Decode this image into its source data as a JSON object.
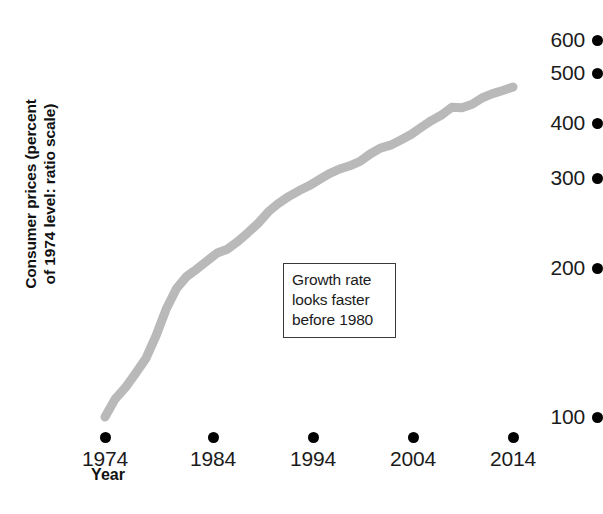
{
  "chart_data": {
    "type": "line",
    "title": "",
    "xlabel": "Year",
    "ylabel": "Consumer prices (percent of 1974 level: ratio scale)",
    "ylabel_line1": "Consumer prices (percent",
    "ylabel_line2": "of 1974 level: ratio scale)",
    "scale": "log",
    "grid": false,
    "legend": "none",
    "series_color": "#b9b9b9",
    "axis_color": "#000000",
    "xlim": [
      1974,
      2014
    ],
    "ylim": [
      100,
      600
    ],
    "xticks": [
      "1974",
      "1984",
      "1994",
      "2004",
      "2014"
    ],
    "xtick_values": [
      1974,
      1984,
      1994,
      2004,
      2014
    ],
    "yticks": [
      "100",
      "200",
      "300",
      "400",
      "500",
      "600"
    ],
    "ytick_values": [
      100,
      200,
      300,
      400,
      500,
      600
    ],
    "x": [
      1974,
      1975,
      1976,
      1977,
      1978,
      1979,
      1980,
      1981,
      1982,
      1983,
      1984,
      1985,
      1986,
      1987,
      1988,
      1989,
      1990,
      1991,
      1992,
      1993,
      1994,
      1995,
      1996,
      1997,
      1998,
      1999,
      2000,
      2001,
      2002,
      2003,
      2004,
      2005,
      2006,
      2007,
      2008,
      2009,
      2010,
      2011,
      2012,
      2013,
      2014
    ],
    "values": [
      100,
      109,
      115,
      123,
      132,
      147,
      167,
      184,
      195,
      202,
      210,
      218,
      222,
      230,
      240,
      251,
      265,
      276,
      285,
      293,
      300,
      309,
      318,
      325,
      330,
      337,
      349,
      359,
      364,
      373,
      383,
      396,
      409,
      420,
      436,
      435,
      442,
      456,
      465,
      472,
      480
    ],
    "annotations": [
      {
        "text": "Growth rate looks faster before 1980",
        "lines": [
          "Growth rate",
          "looks faster",
          "before 1980"
        ],
        "x": 1992,
        "y": 230
      }
    ],
    "markers": {
      "style": "dot",
      "description": "Axis ticks rendered as filled black circles instead of line ticks"
    }
  }
}
